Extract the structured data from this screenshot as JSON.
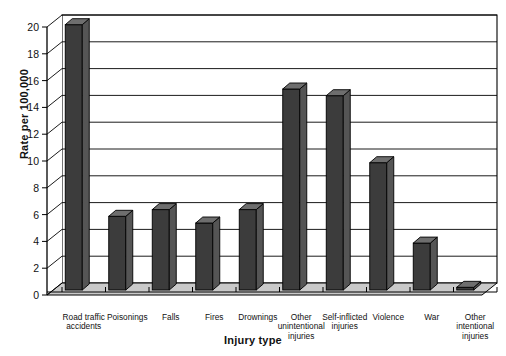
{
  "chart_data": {
    "type": "bar",
    "title": "",
    "xlabel": "Injury type",
    "ylabel": "Rate per 100,000",
    "ylim": [
      0,
      20
    ],
    "ytick_step": 2,
    "yticks": [
      "0",
      "2",
      "4",
      "6",
      "8",
      "10",
      "12",
      "14",
      "16",
      "18",
      "20"
    ],
    "grid": true,
    "legend": "none",
    "style": "3d-bar",
    "bar_color": "#3c3c3c",
    "bar_top_color": "#6e6e6e",
    "bar_side_color": "#555555",
    "floor_color": "#c9c9c9",
    "wall_color": "#ffffff",
    "categories": [
      "Road traffic accidents",
      "Poisonings",
      "Falls",
      "Fires",
      "Drownings",
      "Other unintentional injuries",
      "Self-inflicted injuries",
      "Violence",
      "War",
      "Other intentional injuries"
    ],
    "category_lines": [
      [
        "Road traffic",
        "accidents"
      ],
      [
        "Poisonings"
      ],
      [
        "Falls"
      ],
      [
        "Fires"
      ],
      [
        "Drownings"
      ],
      [
        "Other",
        "unintentional",
        "injuries"
      ],
      [
        "Self-inflicted",
        "injuries"
      ],
      [
        "Violence"
      ],
      [
        "War"
      ],
      [
        "Other",
        "intentional",
        "injuries"
      ]
    ],
    "values": [
      19.8,
      5.5,
      6.0,
      5.0,
      6.0,
      15.0,
      14.5,
      9.5,
      3.5,
      0.2
    ]
  }
}
